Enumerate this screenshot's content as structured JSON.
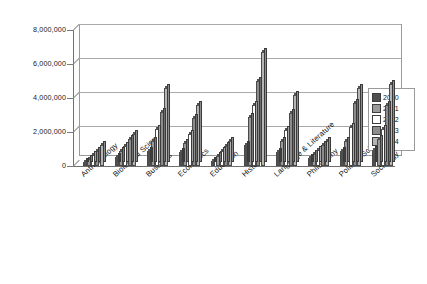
{
  "chart_data": {
    "type": "bar",
    "title": "",
    "subtitle": "",
    "xlabel": "",
    "ylabel": "",
    "ylim": [
      0,
      8000000
    ],
    "yticks": [
      0,
      2000000,
      4000000,
      6000000,
      8000000
    ],
    "ytick_labels": [
      "0",
      "2,000,000",
      "4,000,000",
      "6,000,000",
      "8,000,000"
    ],
    "grid": true,
    "legend_position": "right",
    "style": "3d-clustered-column",
    "categories": [
      "Anthropology",
      "Biological Sciences",
      "Business",
      "Economics",
      "Education",
      "History",
      "Language & Literature",
      "Philosophy",
      "Political Science",
      "Sociology"
    ],
    "series": [
      {
        "name": "2000",
        "color": "#4f4f4f",
        "values": [
          250000,
          550000,
          900000,
          850000,
          300000,
          1250000,
          800000,
          450000,
          900000,
          950000
        ]
      },
      {
        "name": "2001",
        "color": "#9a9a9a",
        "values": [
          420000,
          900000,
          1500000,
          1350000,
          600000,
          2900000,
          1500000,
          700000,
          1500000,
          1600000
        ]
      },
      {
        "name": "2002",
        "color": "#ffffff",
        "values": [
          620000,
          1200000,
          2150000,
          1900000,
          900000,
          3600000,
          2100000,
          950000,
          2300000,
          2200000
        ]
      },
      {
        "name": "2003",
        "color": "#8c8c8c",
        "values": [
          900000,
          1600000,
          3200000,
          2800000,
          1200000,
          5000000,
          3100000,
          1250000,
          3700000,
          3600000
        ]
      },
      {
        "name": "2004",
        "color": "#b5b5b5",
        "values": [
          1250000,
          1900000,
          4600000,
          3600000,
          1500000,
          6700000,
          4200000,
          1500000,
          4600000,
          4800000
        ]
      }
    ]
  },
  "legend": {
    "entries": [
      "2000",
      "2001",
      "2002",
      "2003",
      "2004"
    ]
  }
}
